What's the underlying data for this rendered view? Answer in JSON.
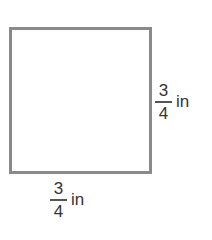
{
  "figure": {
    "shape": "square",
    "border_color": "#8a8a8a",
    "side_labels": {
      "right": {
        "numerator": "3",
        "denominator": "4",
        "unit": "in"
      },
      "bottom": {
        "numerator": "3",
        "denominator": "4",
        "unit": "in"
      }
    }
  }
}
